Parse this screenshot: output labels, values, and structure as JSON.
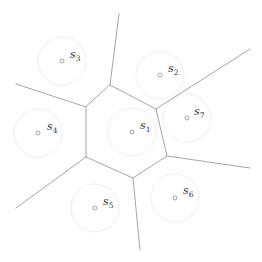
{
  "diagram": {
    "type": "voronoi",
    "colors": {
      "edge": "#9a9a9a",
      "ring": "#ececec",
      "site": "#8a8a8a",
      "label": "#333333",
      "background": "#ffffff"
    },
    "ring_radius": 24,
    "sites": [
      {
        "id": "s1",
        "base": "s",
        "sub": "1",
        "x": 132,
        "y": 132,
        "lx": 140,
        "ly": 129
      },
      {
        "id": "s2",
        "base": "s",
        "sub": "2",
        "x": 160,
        "y": 75,
        "lx": 168,
        "ly": 72
      },
      {
        "id": "s3",
        "base": "s",
        "sub": "3",
        "x": 62,
        "y": 61,
        "lx": 70,
        "ly": 58
      },
      {
        "id": "s4",
        "base": "s",
        "sub": "4",
        "x": 38,
        "y": 133,
        "lx": 47,
        "ly": 130
      },
      {
        "id": "s5",
        "base": "s",
        "sub": "5",
        "x": 95,
        "y": 208,
        "lx": 103,
        "ly": 205
      },
      {
        "id": "s6",
        "base": "s",
        "sub": "6",
        "x": 175,
        "y": 198,
        "lx": 183,
        "ly": 194
      },
      {
        "id": "s7",
        "base": "s",
        "sub": "7",
        "x": 187,
        "y": 118,
        "lx": 194,
        "ly": 115
      }
    ],
    "cell_vertices": [
      {
        "id": "v_top",
        "x": 110,
        "y": 85
      },
      {
        "id": "v_top_right",
        "x": 156,
        "y": 109
      },
      {
        "id": "v_right",
        "x": 167,
        "y": 156
      },
      {
        "id": "v_bottom",
        "x": 133,
        "y": 178
      },
      {
        "id": "v_bottom_left",
        "x": 86,
        "y": 157
      },
      {
        "id": "v_left",
        "x": 86,
        "y": 107
      }
    ],
    "rays": [
      {
        "from": "v_top",
        "x": 119,
        "y": 14
      },
      {
        "from": "v_top_right",
        "x": 250,
        "y": 49
      },
      {
        "from": "v_right",
        "x": 250,
        "y": 168
      },
      {
        "from": "v_bottom",
        "x": 140,
        "y": 250
      },
      {
        "from": "v_bottom_left",
        "x": 16,
        "y": 208
      },
      {
        "from": "v_left",
        "x": 16,
        "y": 84
      }
    ]
  }
}
